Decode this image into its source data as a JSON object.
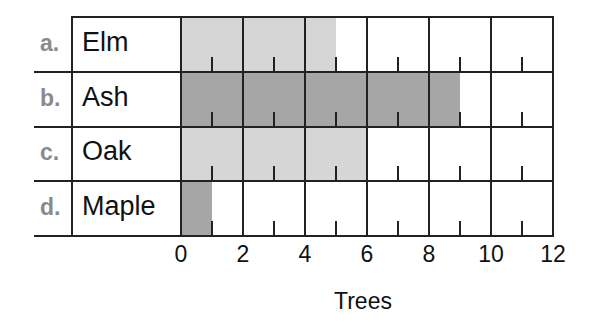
{
  "chart_data": {
    "type": "bar",
    "orientation": "horizontal",
    "title": "",
    "xlabel": "Trees",
    "ylabel": "",
    "categories": [
      "Elm",
      "Ash",
      "Oak",
      "Maple"
    ],
    "row_letters": [
      "a.",
      "b.",
      "c.",
      "d."
    ],
    "values": [
      5,
      9,
      6,
      1
    ],
    "bar_colors": [
      "#d6d6d6",
      "#a6a6a6",
      "#d6d6d6",
      "#a6a6a6"
    ],
    "xlim": [
      0,
      12
    ],
    "x_ticks": [
      "0",
      "2",
      "4",
      "6",
      "8",
      "10",
      "12"
    ],
    "minor_tick_step": 1,
    "major_gridline_step": 2,
    "grid": true,
    "legend": null
  }
}
